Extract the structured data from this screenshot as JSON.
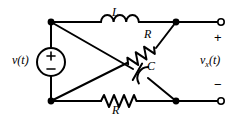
{
  "figure": {
    "stroke_color": "#000000",
    "background_color": "#ffffff",
    "width": 242,
    "height": 122
  },
  "source": {
    "label": "v(t)",
    "plus": "+",
    "minus": "−",
    "symbol": "voltage-source-circle"
  },
  "components": {
    "inductor_top": {
      "label": "L",
      "type": "inductor",
      "coils": 3,
      "branch": "top-left-node to top-right-node"
    },
    "resistor_diagonal": {
      "label": "R",
      "type": "resistor",
      "zigzags": 4,
      "branch": "bottom-left-node to top-right-node"
    },
    "capacitor_diagonal": {
      "label": "C",
      "type": "capacitor",
      "branch": "top-left-node to bottom-right-node"
    },
    "resistor_bottom": {
      "label": "R",
      "type": "resistor",
      "zigzags": 4,
      "branch": "bottom-left-node to bottom-right-node"
    }
  },
  "output": {
    "label": "v",
    "subscript": "x",
    "argument": "(t)",
    "full_label": "vx(t)",
    "plus": "+",
    "minus": "−",
    "terminal_top": "open-terminal",
    "terminal_bottom": "open-terminal"
  },
  "nodes": {
    "top_left": "junction-dot",
    "bottom_left": "junction-dot",
    "top_right": "junction-dot",
    "bottom_right": "junction-dot",
    "center_crossing": "no-connection-crossover"
  }
}
